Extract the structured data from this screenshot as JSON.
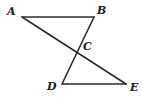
{
  "figure": {
    "background_color": "#ffffff",
    "line_color": "#2b2b2b",
    "label_color": "#232323",
    "width": 143,
    "height": 98,
    "points": {
      "A": {
        "label": "A",
        "x": 22,
        "y": 17,
        "label_x": 7,
        "label_y": 6
      },
      "B": {
        "label": "B",
        "x": 94,
        "y": 17,
        "label_x": 97,
        "label_y": 5
      },
      "C": {
        "label": "C",
        "x": 79,
        "y": 47,
        "label_x": 83,
        "label_y": 41
      },
      "D": {
        "label": "D",
        "x": 62,
        "y": 84,
        "label_x": 47,
        "label_y": 81
      },
      "E": {
        "label": "E",
        "x": 126,
        "y": 84,
        "label_x": 130,
        "label_y": 82
      }
    },
    "segments": [
      {
        "name": "segment-AB",
        "from": "A",
        "to": "B",
        "d": "M 22 17 L 94 17"
      },
      {
        "name": "segment-AE",
        "from": "A",
        "to": "E",
        "d": "M 22 17 L 126 84"
      },
      {
        "name": "segment-BD",
        "from": "B",
        "to": "D",
        "d": "M 94 17 L 62 84"
      },
      {
        "name": "segment-DE",
        "from": "D",
        "to": "E",
        "d": "M 62 84 L 126 84"
      }
    ]
  }
}
